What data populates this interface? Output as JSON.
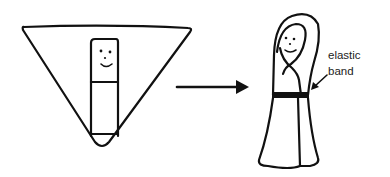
{
  "figure": {
    "step1": {
      "name": "flat-layout",
      "shape": "inverted triangle of fabric",
      "object": "rectangular strip with smiley face at top"
    },
    "transition": {
      "name": "arrow",
      "direction": "right"
    },
    "step2": {
      "name": "wrapped-figure",
      "shape": "hooded robe figure with smiley face",
      "annotation": {
        "line1": "elastic",
        "line2": "band"
      }
    },
    "colors": {
      "ink": "#111111",
      "background": "#ffffff",
      "band": "#111111"
    }
  }
}
